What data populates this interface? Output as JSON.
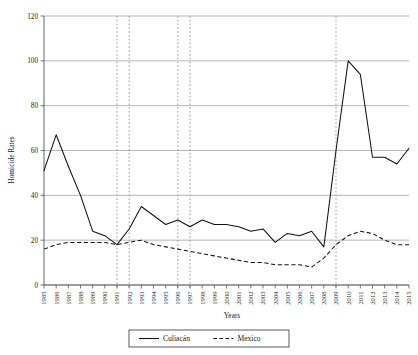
{
  "chart_data": {
    "type": "line",
    "title": "",
    "xlabel": "Years",
    "ylabel": "Homicide Rates",
    "ylim": [
      0,
      120
    ],
    "yticks": [
      0,
      20,
      40,
      60,
      80,
      100,
      120
    ],
    "grid": true,
    "legend_position": "bottom",
    "categories": [
      "1985",
      "1986",
      "1987",
      "1988",
      "1989",
      "1990",
      "1991",
      "1992",
      "1993",
      "1994",
      "1995",
      "1996",
      "1997",
      "1998",
      "1999",
      "2000",
      "2001",
      "2002",
      "2003",
      "2004",
      "2005",
      "2006",
      "2007",
      "2008",
      "2009",
      "2010",
      "2011",
      "2012",
      "2013",
      "2014",
      "2015"
    ],
    "series": [
      {
        "name": "Culiacán",
        "style": "solid",
        "values": [
          51,
          67,
          53,
          40,
          24,
          22,
          18,
          25,
          35,
          31,
          27,
          29,
          26,
          29,
          27,
          27,
          26,
          24,
          25,
          19,
          23,
          22,
          24,
          17,
          60,
          100,
          94,
          57,
          57,
          54,
          61
        ]
      },
      {
        "name": "Mexico",
        "style": "dashed",
        "values": [
          16,
          18,
          19,
          19,
          19,
          19,
          18,
          19,
          20,
          18,
          17,
          16,
          15,
          14,
          13,
          12,
          11,
          10,
          10,
          9,
          9,
          9,
          8,
          12,
          18,
          22,
          24,
          23,
          20,
          18,
          18
        ]
      }
    ],
    "vertical_markers": [
      {
        "year": "1991",
        "style": "dotted"
      },
      {
        "year": "1992",
        "style": "dotted"
      },
      {
        "year": "1996",
        "style": "dotted"
      },
      {
        "year": "1997",
        "style": "dotted"
      },
      {
        "year": "2009",
        "style": "dotted"
      }
    ]
  },
  "legend": {
    "items": [
      {
        "label": "Culiacán",
        "style": "solid"
      },
      {
        "label": "Mexico",
        "style": "dashed"
      }
    ]
  }
}
